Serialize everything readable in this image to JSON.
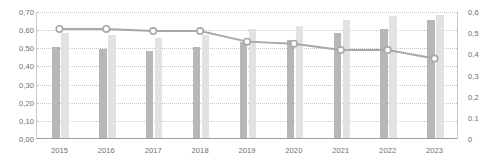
{
  "chart_data": {
    "type": "bar",
    "title": "",
    "subtitle": "",
    "xlabel": "",
    "ylabel": "",
    "categories": [
      "2015",
      "2016",
      "2017",
      "2018",
      "2019",
      "2020",
      "2021",
      "2022",
      "2023"
    ],
    "grid": true,
    "legend": "none",
    "axes": {
      "left": {
        "ylim": [
          0.0,
          0.7
        ],
        "tick_step": 0.1,
        "ticks": [
          "0,00",
          "0,10",
          "0,20",
          "0,30",
          "0,40",
          "0,50",
          "0,60",
          "0,70"
        ],
        "tick_values": [
          0.0,
          0.1,
          0.2,
          0.3,
          0.4,
          0.5,
          0.6,
          0.7
        ]
      },
      "right": {
        "ylim": [
          0.0,
          0.6
        ],
        "tick_step": 0.1,
        "ticks": [
          "0",
          "0,1",
          "0,2",
          "0,3",
          "0,4",
          "0,5",
          "0,6"
        ],
        "tick_values": [
          0.0,
          0.1,
          0.2,
          0.3,
          0.4,
          0.5,
          0.6
        ]
      }
    },
    "series": [
      {
        "name": "dark-bar-series",
        "kind": "bar",
        "axis": "left",
        "color": "#b7b7b7",
        "values": [
          0.5,
          0.49,
          0.48,
          0.5,
          0.53,
          0.54,
          0.58,
          0.6,
          0.65
        ]
      },
      {
        "name": "light-bar-series",
        "kind": "bar",
        "axis": "left",
        "color": "#e2e2e2",
        "values": [
          0.58,
          0.57,
          0.55,
          0.57,
          0.6,
          0.62,
          0.65,
          0.67,
          0.68
        ]
      },
      {
        "name": "line-series",
        "kind": "line",
        "axis": "right",
        "color": "#a8a8a8",
        "marker": "circle-open",
        "values": [
          0.52,
          0.52,
          0.51,
          0.51,
          0.46,
          0.45,
          0.42,
          0.42,
          0.38
        ]
      }
    ]
  },
  "colors": {
    "bar_dark": "#b7b7b7",
    "bar_light": "#e2e2e2",
    "line": "#a8a8a8",
    "grid": "#c4c4c4",
    "axis": "#9e9e9e",
    "text": "#6e6e6e",
    "background": "#ffffff"
  }
}
